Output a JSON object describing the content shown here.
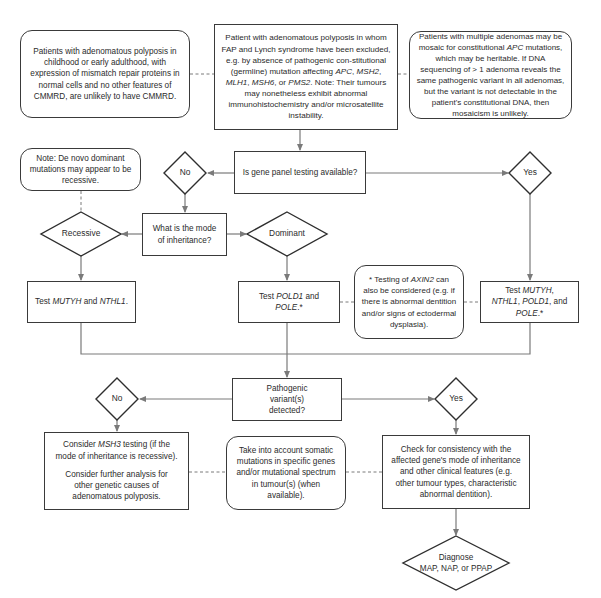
{
  "diagram": {
    "type": "flowchart",
    "colors": {
      "stroke": "#3a3a3a",
      "connector": "#7a7a7a",
      "background": "#ffffff"
    },
    "notes": {
      "cmmrd": "Patients with adenomatous polyposis in childhood or early adulthood, with expression of mismatch repair proteins in normal cells and no other features of CMMRD, are unlikely to have CMMRD.",
      "mosaic_part1": "Patients with multiple adenomas may be mosaic for constitutional ",
      "mosaic_gene": "APC",
      "mosaic_part2": " mutations, which may be heritable. If DNA sequencing of > 1 adenoma reveals the same pathogenic variant in all adenomas, but the variant is not detectable in the patient's constitutional DNA, then mosaicism is unlikely.",
      "de_novo": "Note: De novo dominant mutations may appear to be recessive.",
      "axin2_part1": "* Testing of ",
      "axin2_gene": "AXIN2",
      "axin2_part2": " can also be considered (e.g. if there is abnormal dentition and/or signs of ectodermal dysplasia).",
      "somatic": "Take into account somatic mutations in specific genes and/or mutational spectrum in tumour(s) (when available)."
    },
    "start": {
      "part1": "Patient with adenomatous polyposis in whom FAP and Lynch syndrome have been excluded, e.g. by absence of pathogenic con-stitutional (germline) mutation affecting ",
      "gene1": "APC",
      "sep1": ", ",
      "gene2": "MSH2",
      "sep2": ", ",
      "gene3": "MLH1",
      "sep3": ", ",
      "gene4": "MSH6",
      "sep4": ", or ",
      "gene5": "PMS2",
      "part2": ". Note: Their tumours may nonetheless exhibit abnormal immunohistochemistry and/or microsatellite instability."
    },
    "q_panel": "Is gene panel testing available?",
    "panel_no": "No",
    "panel_yes": "Yes",
    "q_inheritance": "What is the mode of inheritance?",
    "recessive": "Recessive",
    "dominant": "Dominant",
    "test_recessive": {
      "prefix": "Test ",
      "g1": "MUTYH",
      "mid": " and ",
      "g2": "NTHL1",
      "suffix": "."
    },
    "test_dominant": {
      "prefix": "Test ",
      "g1": "POLD1",
      "mid": " and ",
      "g2": "POLE",
      "suffix": ".*"
    },
    "test_panel": {
      "prefix": "Test ",
      "g1": "MUTYH",
      "s1": ", ",
      "g2": "NTHL1",
      "s2": ", ",
      "g3": "POLD1",
      "s3": ", and ",
      "g4": "POLE",
      "suffix": ".*"
    },
    "q_detected": "Pathogenic variant(s) detected?",
    "detected_no": "No",
    "detected_yes": "Yes",
    "consider_msh3": {
      "prefix": "Consider ",
      "gene": "MSH3",
      "suffix": " testing (if the mode of inheritance is recessive)."
    },
    "consider_further": "Consider further analysis for other genetic causes of adenomatous polyposis.",
    "check_consistency": "Check for consistency with the affected gene's mode of inheritance and other clinical features (e.g. other tumour types, characteristic abnormal dentition).",
    "diagnose_line1": "Diagnose",
    "diagnose_line2": "MAP, NAP, or PPAP"
  }
}
